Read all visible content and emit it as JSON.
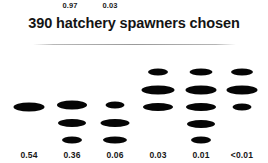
{
  "chart_data": {
    "type": "scatter",
    "title": "390 hatchery spawners chosen",
    "xlabel": "",
    "ylabel": "",
    "grid": false,
    "legend": null,
    "top_labels": [
      {
        "text": "0.97",
        "x": 70
      },
      {
        "text": "0.03",
        "x": 110
      }
    ],
    "bottom_labels": [
      "0.54",
      "0.36",
      "0.06",
      "0.03",
      "0.01",
      "<0.01"
    ],
    "marker_color": "#050505",
    "columns": [
      {
        "label": "0.54",
        "x": 29,
        "count": 1,
        "markers": [
          {
            "y": 107,
            "w": 31,
            "h": 9
          }
        ]
      },
      {
        "label": "0.36",
        "x": 72,
        "count": 3,
        "markers": [
          {
            "y": 105,
            "w": 30,
            "h": 9
          },
          {
            "y": 123,
            "w": 28,
            "h": 8
          },
          {
            "y": 140,
            "w": 20,
            "h": 7
          }
        ]
      },
      {
        "label": "0.06",
        "x": 115,
        "count": 3,
        "markers": [
          {
            "y": 105,
            "w": 19,
            "h": 7
          },
          {
            "y": 123,
            "w": 29,
            "h": 8
          },
          {
            "y": 140,
            "w": 24,
            "h": 7
          }
        ]
      },
      {
        "label": "0.03",
        "x": 158,
        "count": 3,
        "markers": [
          {
            "y": 72,
            "w": 20,
            "h": 7
          },
          {
            "y": 90,
            "w": 33,
            "h": 9
          },
          {
            "y": 107,
            "w": 30,
            "h": 8
          }
        ]
      },
      {
        "label": "0.01",
        "x": 201,
        "count": 5,
        "markers": [
          {
            "y": 72,
            "w": 23,
            "h": 7
          },
          {
            "y": 90,
            "w": 31,
            "h": 9
          },
          {
            "y": 107,
            "w": 30,
            "h": 8
          },
          {
            "y": 124,
            "w": 28,
            "h": 8
          },
          {
            "y": 140,
            "w": 20,
            "h": 7
          }
        ]
      },
      {
        "label": "<0.01",
        "x": 242,
        "count": 3,
        "markers": [
          {
            "y": 72,
            "w": 22,
            "h": 7
          },
          {
            "y": 90,
            "w": 31,
            "h": 9
          },
          {
            "y": 107,
            "w": 19,
            "h": 7
          }
        ]
      }
    ]
  }
}
